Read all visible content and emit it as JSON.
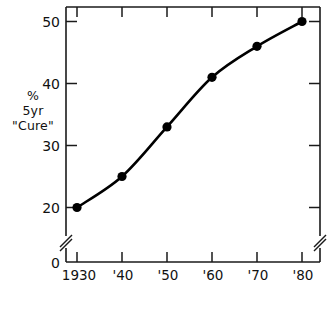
{
  "chart_data": {
    "type": "line",
    "title": "",
    "xlabel": "",
    "ylabel": "% 5yr \"Cure\"",
    "ylabel_lines": [
      "%",
      "5yr",
      "\"Cure\""
    ],
    "x": [
      1930,
      1940,
      1950,
      1960,
      1970,
      1980
    ],
    "xtick_labels": [
      "1930",
      "'40",
      "'50",
      "'60",
      "'70",
      "'80"
    ],
    "values": [
      20,
      25,
      33,
      41,
      46,
      50
    ],
    "ytick_labels": [
      "50",
      "40",
      "30",
      "20"
    ],
    "ytick_values": [
      50,
      40,
      30,
      20
    ],
    "zero_label": "0",
    "ylim": [
      20,
      52
    ],
    "xlim": [
      1926,
      1984
    ],
    "grid": false,
    "legend": null,
    "axis_break": true,
    "marker": "filled-circle",
    "line_color": "#000000",
    "marker_color": "#000000",
    "axis_color": "#1a1a1a",
    "background": "#ffffff"
  },
  "caption": {
    "text": ""
  }
}
